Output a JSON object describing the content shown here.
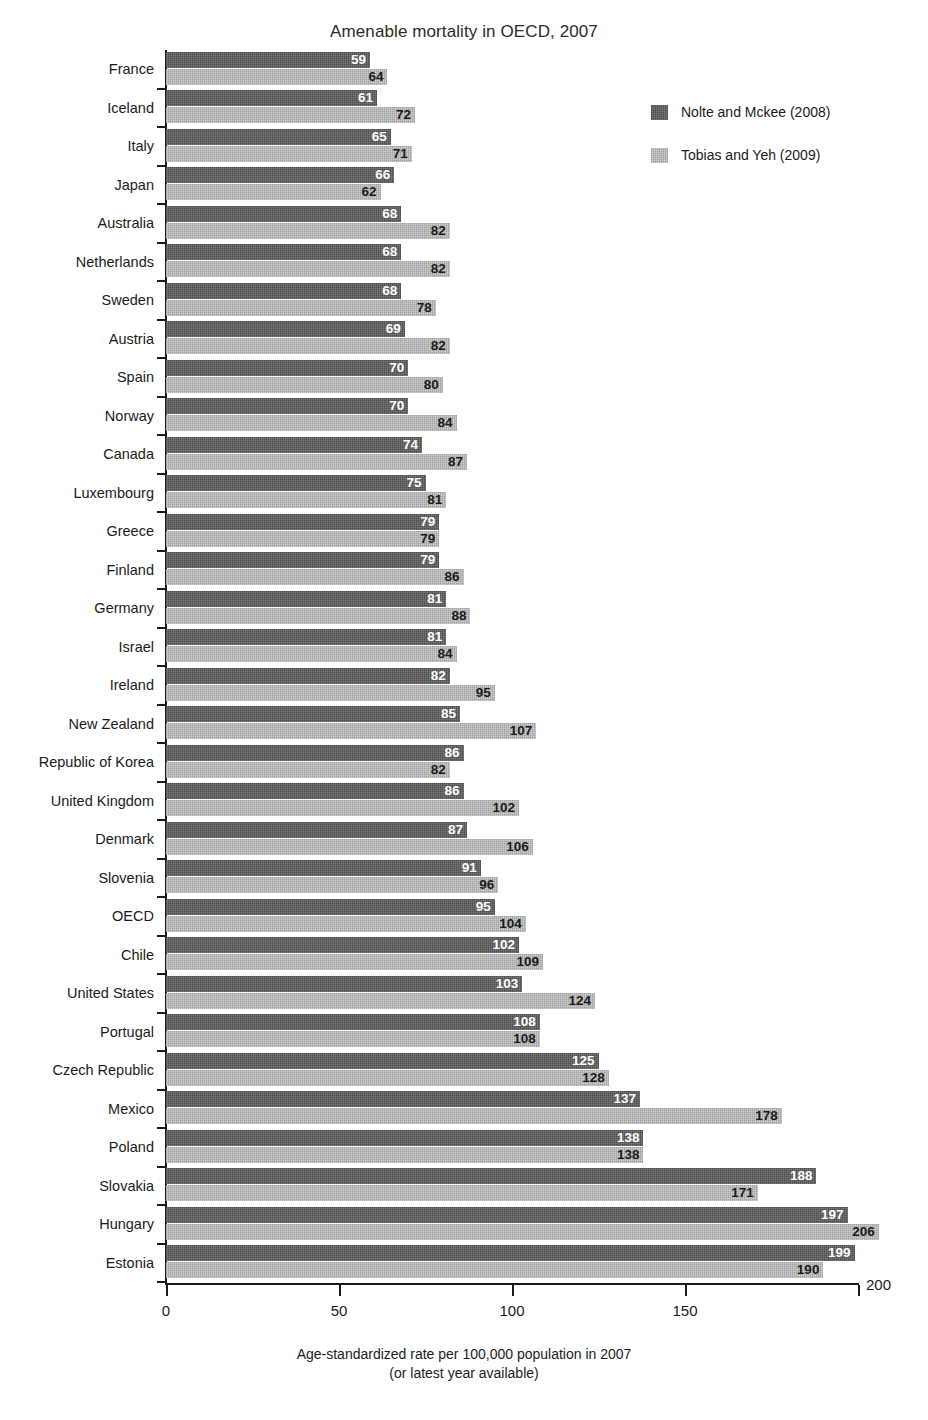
{
  "chart_data": {
    "type": "bar",
    "orientation": "horizontal",
    "grouped": true,
    "title": "Amenable mortality in OECD, 2007",
    "xlabel_line1": "Age-standardized rate per 100,000 population in 2007",
    "xlabel_line2": "(or latest year available)",
    "ylabel": "",
    "xlim": [
      0,
      200
    ],
    "xticks": [
      0,
      50,
      100,
      150,
      200
    ],
    "xtick_labels": [
      "0",
      "50",
      "100",
      "150",
      "200"
    ],
    "grid": false,
    "legend_position": "upper right (inside plot)",
    "colors": {
      "series_1": "#5d5d5d",
      "series_2": "#b3b3b3",
      "axis": "#1b1b1b",
      "background": "#ffffff"
    },
    "categories": [
      "France",
      "Iceland",
      "Italy",
      "Japan",
      "Australia",
      "Netherlands",
      "Sweden",
      "Austria",
      "Spain",
      "Norway",
      "Canada",
      "Luxembourg",
      "Greece",
      "Finland",
      "Germany",
      "Israel",
      "Ireland",
      "New Zealand",
      "Republic of Korea",
      "United Kingdom",
      "Denmark",
      "Slovenia",
      "OECD",
      "Chile",
      "United States",
      "Portugal",
      "Czech Republic",
      "Mexico",
      "Poland",
      "Slovakia",
      "Hungary",
      "Estonia"
    ],
    "series": [
      {
        "name": "Nolte and Mckee (2008)",
        "color": "#5d5d5d",
        "values": [
          59,
          61,
          65,
          66,
          68,
          68,
          68,
          69,
          70,
          70,
          74,
          75,
          79,
          79,
          81,
          81,
          82,
          85,
          86,
          86,
          87,
          91,
          95,
          102,
          103,
          108,
          125,
          137,
          138,
          188,
          197,
          199
        ]
      },
      {
        "name": "Tobias and Yeh (2009)",
        "color": "#b3b3b3",
        "values": [
          64,
          72,
          71,
          62,
          82,
          82,
          78,
          82,
          80,
          84,
          87,
          81,
          79,
          86,
          88,
          84,
          95,
          107,
          82,
          102,
          106,
          96,
          104,
          109,
          124,
          108,
          128,
          178,
          138,
          171,
          206,
          190
        ]
      }
    ]
  },
  "legend": {
    "items": [
      {
        "label": "Nolte and Mckee (2008)",
        "color": "#5d5d5d"
      },
      {
        "label": "Tobias and Yeh (2009)",
        "color": "#b3b3b3"
      }
    ]
  }
}
